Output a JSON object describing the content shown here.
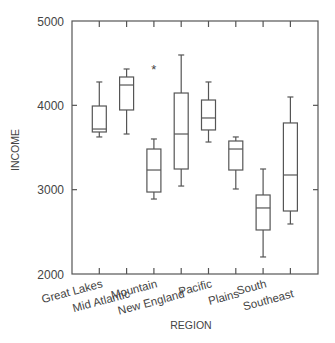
{
  "chart_data": {
    "type": "box",
    "title": "",
    "xlabel": "REGION",
    "ylabel": "INCOME",
    "ylim": [
      2000,
      5000
    ],
    "yticks": [
      2000,
      3000,
      4000,
      5000
    ],
    "grid": false,
    "legend": null,
    "categories": [
      "Great Lakes",
      "Mid Atlantic",
      "Mountain",
      "New England",
      "Pacific",
      "Plains",
      "South",
      "Southeast"
    ],
    "series": [
      {
        "name": "Great Lakes",
        "whisker_low": 3625,
        "q1": 3684,
        "median": 3719,
        "q3": 3992,
        "whisker_high": 4277,
        "outliers": []
      },
      {
        "name": "Mid Atlantic",
        "whisker_low": 3660,
        "q1": 3945,
        "median": 4241,
        "q3": 4336,
        "whisker_high": 4431,
        "outliers": []
      },
      {
        "name": "Mountain",
        "whisker_low": 2889,
        "q1": 2972,
        "median": 3233,
        "q3": 3482,
        "whisker_high": 3601,
        "outliers": [
          4443
        ]
      },
      {
        "name": "New England",
        "whisker_low": 3043,
        "q1": 3245,
        "median": 3660,
        "q3": 4146,
        "whisker_high": 4597,
        "outliers": []
      },
      {
        "name": "Pacific",
        "whisker_low": 3565,
        "q1": 3708,
        "median": 3850,
        "q3": 4063,
        "whisker_high": 4277,
        "outliers": []
      },
      {
        "name": "Plains",
        "whisker_low": 3008,
        "q1": 3233,
        "median": 3482,
        "q3": 3577,
        "whisker_high": 3625,
        "outliers": []
      },
      {
        "name": "South",
        "whisker_low": 2202,
        "q1": 2522,
        "median": 2783,
        "q3": 2937,
        "whisker_high": 3245,
        "outliers": []
      },
      {
        "name": "Southeast",
        "whisker_low": 2593,
        "q1": 2747,
        "median": 3174,
        "q3": 3791,
        "whisker_high": 4099,
        "outliers": []
      }
    ],
    "outlier_marker": "*"
  },
  "axes": {
    "y_title": "INCOME",
    "x_title": "REGION",
    "y_tick_labels": [
      "5000",
      "4000",
      "3000",
      "2000"
    ]
  }
}
